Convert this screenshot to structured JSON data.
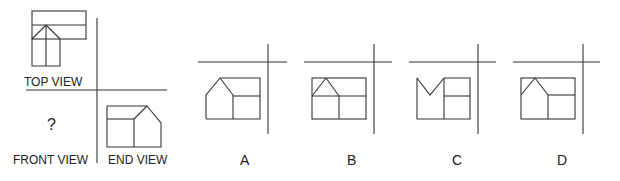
{
  "labels": {
    "top_view": "TOP VIEW",
    "front_view": "FRONT VIEW",
    "end_view": "END VIEW",
    "unknown": "?"
  },
  "options": [
    {
      "id": "A",
      "label": "A"
    },
    {
      "id": "B",
      "label": "B"
    },
    {
      "id": "C",
      "label": "C"
    },
    {
      "id": "D",
      "label": "D"
    }
  ],
  "colors": {
    "line": "#333333",
    "text": "#222222",
    "background": "#ffffff"
  }
}
